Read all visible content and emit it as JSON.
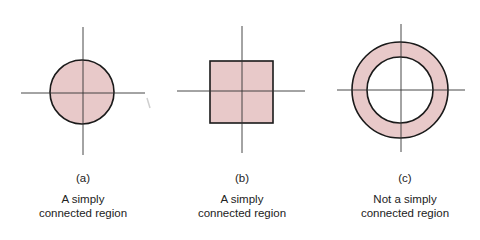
{
  "figure": {
    "fill_color": "#e8c9c9",
    "stroke_color": "#1a1a1a",
    "axis_color": "#333333",
    "panels": [
      {
        "id": "a",
        "label": "(a)",
        "desc_line1": "A simply",
        "desc_line2": "connected region",
        "shape": "disk",
        "center": [
          82,
          92
        ],
        "radius": 32,
        "axes": {
          "vx": 83,
          "vy1": 27,
          "vy2": 155,
          "hy": 93,
          "hx1": 21,
          "hx2": 145
        }
      },
      {
        "id": "b",
        "label": "(b)",
        "desc_line1": "A simply",
        "desc_line2": "connected region",
        "shape": "square",
        "rect": [
          210,
          61,
          63,
          62
        ],
        "axes": {
          "vx": 242,
          "vy1": 26,
          "vy2": 153,
          "hy": 91,
          "hx1": 177,
          "hx2": 305
        }
      },
      {
        "id": "c",
        "label": "(c)",
        "desc_line1": "Not a simply",
        "desc_line2": "connected region",
        "shape": "annulus",
        "center": [
          400,
          90
        ],
        "outer_radius": 48,
        "inner_radius": 33,
        "axes": {
          "vx": 401,
          "vy1": 24,
          "vy2": 152,
          "hy": 90,
          "hx1": 337,
          "hx2": 465
        }
      }
    ]
  }
}
